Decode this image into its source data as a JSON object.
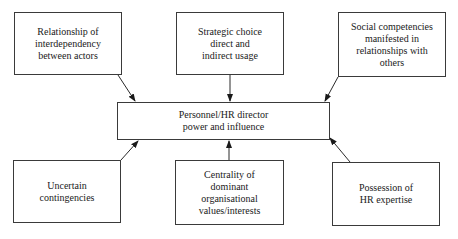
{
  "diagram": {
    "center": {
      "label": "Personnel/HR director\npower and influence"
    },
    "factors": [
      {
        "id": "top-left",
        "label": "Relationship of\ninterdependency\nbetween actors"
      },
      {
        "id": "top-center",
        "label": "Strategic choice\ndirect and\nindirect usage"
      },
      {
        "id": "top-right",
        "label": "Social competencies\nmanifested in\nrelationships with\nothers"
      },
      {
        "id": "bottom-left",
        "label": "Uncertain\ncontingencies"
      },
      {
        "id": "bottom-center",
        "label": "Centrality of\ndominant organisational\nvalues/interests"
      },
      {
        "id": "bottom-right",
        "label": "Possession of\nHR expertise"
      }
    ]
  }
}
